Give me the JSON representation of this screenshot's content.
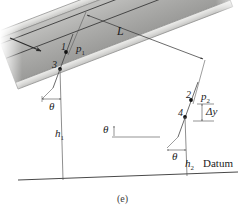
{
  "figure": {
    "caption": "(e)",
    "domain_subject": "inclined-pipe-flow-energy-diagram",
    "background_color": "#ffffff",
    "ink_color": "#1c1c1c"
  },
  "labels": {
    "length": "L",
    "point_1": "1",
    "point_2": "2",
    "point_3": "3",
    "point_4": "4",
    "pressure_1": "p",
    "pressure_1_sub": "1",
    "pressure_2": "p",
    "pressure_2_sub": "2",
    "height_1": "h",
    "height_1_sub": "1",
    "height_2": "h",
    "height_2_sub": "2",
    "theta_left": "θ",
    "theta_middle": "θ",
    "theta_right": "θ",
    "delta_y": "Δy",
    "datum": "Datum"
  },
  "icons": {
    "flow_arrow": "flow-direction-arrow",
    "dimension_arrow_left": "dimension-arrow-left",
    "dimension_arrow_right": "dimension-arrow-right"
  },
  "colors": {
    "pipe_wall": "#d8d8d6",
    "pipe_wall_edge": "#9a9a98",
    "pipe_fill_light": "#b9b9b7",
    "pipe_fill_dark": "#9d9d9b",
    "stream_line": "#4a4a4a",
    "datum_line": "#4a4a4a",
    "leader_line": "#5a5a5a",
    "marker_dot": "#111111"
  },
  "geometry": {
    "pipe_angle_deg": -21,
    "pipe_axis_start": [
      30,
      52
    ],
    "pipe_axis_end": [
      226,
      128
    ],
    "datum_y_left": 178,
    "datum_y_right": 172
  }
}
